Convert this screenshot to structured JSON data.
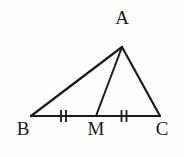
{
  "figure": {
    "background_color": "#fefefe",
    "stroke_color": "#1b1b1b",
    "label_color": "#1b1b1b",
    "stroke_width": 2.2,
    "tick_stroke_width": 1.8
  },
  "labels": {
    "apex": "A",
    "bottom_left": "B",
    "midpoint": "M",
    "bottom_right": "C"
  },
  "points": {
    "A": {
      "x": 122,
      "y": 47
    },
    "B": {
      "x": 31,
      "y": 116
    },
    "M": {
      "x": 96,
      "y": 116
    },
    "C": {
      "x": 160,
      "y": 116
    }
  },
  "segments": [
    {
      "name": "side-AB",
      "from": "B",
      "to": "A"
    },
    {
      "name": "side-AC",
      "from": "A",
      "to": "C"
    },
    {
      "name": "side-BC",
      "from": "B",
      "to": "C"
    },
    {
      "name": "median-AM",
      "from": "A",
      "to": "M"
    }
  ],
  "congruence_marks": [
    {
      "name": "tick-BM",
      "segment": "BM",
      "count": 2,
      "center_x": 63.5,
      "center_y": 116,
      "tick_half_height": 6,
      "tick_gap": 5
    },
    {
      "name": "tick-MC",
      "segment": "MC",
      "count": 2,
      "center_x": 124.0,
      "center_y": 116,
      "tick_half_height": 6,
      "tick_gap": 5
    }
  ]
}
